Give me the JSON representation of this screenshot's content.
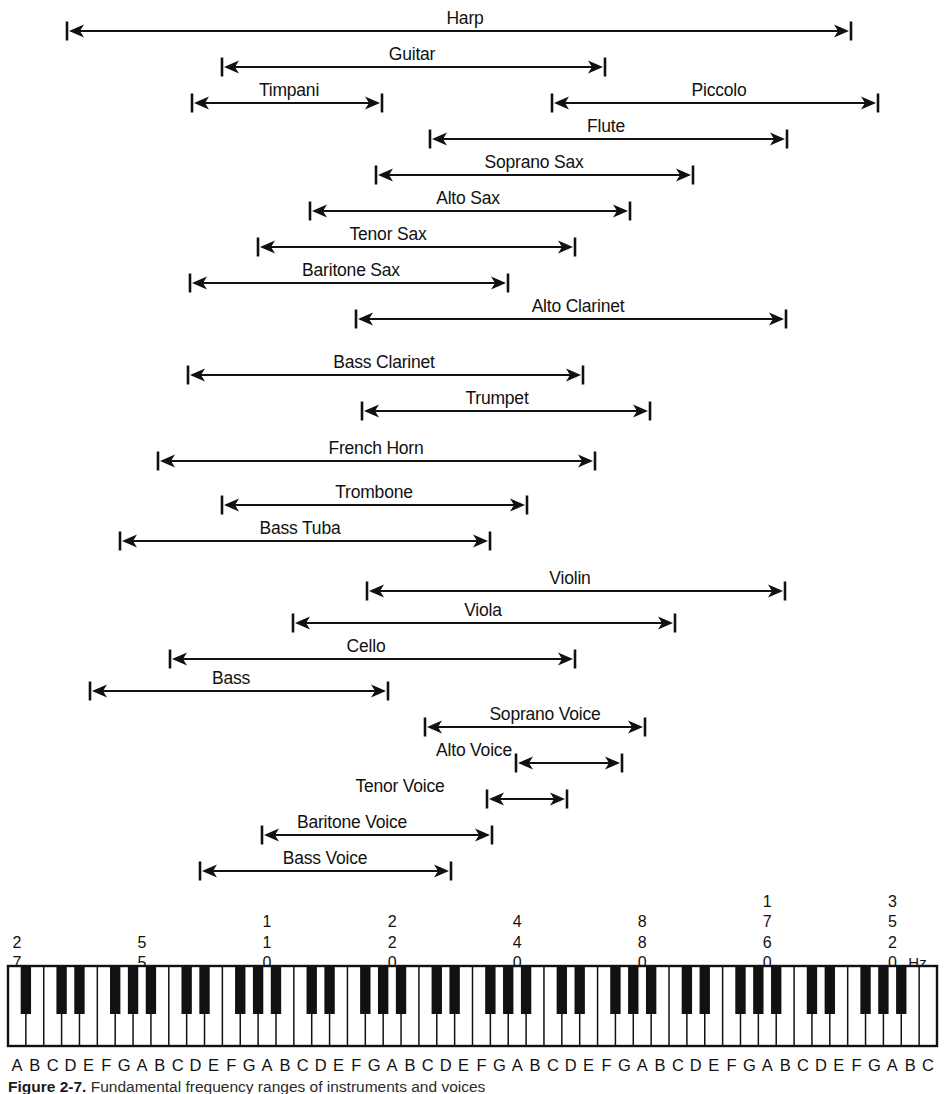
{
  "figure": {
    "caption_prefix": "Figure  2-7.",
    "caption_text": "Fundamental frequency ranges of instruments and voices",
    "hz_unit": "Hz",
    "keyboard": {
      "total_keys": 88,
      "white_keys": 52,
      "start_note": "A",
      "end_note": "C",
      "note_letters": [
        "A",
        "B",
        "C",
        "D",
        "E",
        "F",
        "G",
        "A",
        "B",
        "C",
        "D",
        "E",
        "F",
        "G",
        "A",
        "B",
        "C",
        "D",
        "E",
        "F",
        "G",
        "A",
        "B",
        "C",
        "D",
        "E",
        "F",
        "G",
        "A",
        "B",
        "C",
        "D",
        "E",
        "F",
        "G",
        "A",
        "B",
        "C",
        "D",
        "E",
        "F",
        "G",
        "A",
        "B",
        "C",
        "D",
        "E",
        "F",
        "G",
        "A",
        "B",
        "C"
      ]
    }
  },
  "chart_data": {
    "type": "bar",
    "title": "Fundamental frequency ranges of instruments and voices",
    "xlabel": "Frequency (Hz)",
    "ylabel": "",
    "x_scale": "log (piano keyboard)",
    "xlim": [
      27.5,
      4186
    ],
    "grid": false,
    "legend": "none",
    "frequency_ticks": [
      {
        "label": "27",
        "digits": [
          "2",
          "7"
        ],
        "white_key_index": 0
      },
      {
        "label": "55",
        "digits": [
          "5",
          "5"
        ],
        "white_key_index": 7
      },
      {
        "label": "110",
        "digits": [
          "1",
          "1",
          "0"
        ],
        "white_key_index": 14
      },
      {
        "label": "220",
        "digits": [
          "2",
          "2",
          "0"
        ],
        "white_key_index": 21
      },
      {
        "label": "440",
        "digits": [
          "4",
          "4",
          "0"
        ],
        "white_key_index": 28
      },
      {
        "label": "880",
        "digits": [
          "8",
          "8",
          "0"
        ],
        "white_key_index": 35
      },
      {
        "label": "1760",
        "digits": [
          "1",
          "7",
          "6",
          "0"
        ],
        "white_key_index": 42
      },
      {
        "label": "3520",
        "digits": [
          "3",
          "5",
          "2",
          "0"
        ],
        "white_key_index": 49
      }
    ],
    "categories": [
      "Harp",
      "Guitar",
      "Timpani",
      "Piccolo",
      "Flute",
      "Soprano Sax",
      "Alto Sax",
      "Tenor Sax",
      "Baritone Sax",
      "Alto Clarinet",
      "Bass Clarinet",
      "Trumpet",
      "French Horn",
      "Trombone",
      "Bass Tuba",
      "Violin",
      "Viola",
      "Cello",
      "Bass",
      "Soprano Voice",
      "Alto Voice",
      "Tenor Voice",
      "Baritone Voice",
      "Bass Voice"
    ],
    "ranges": [
      {
        "name": "Harp",
        "row": 0,
        "x1": 67,
        "x2": 851,
        "label_x": 465,
        "label_y": 12
      },
      {
        "name": "Guitar",
        "row": 1,
        "x1": 222,
        "x2": 605,
        "label_x": 412,
        "label_y": 48
      },
      {
        "name": "Timpani",
        "row": 2,
        "x1": 192,
        "x2": 382,
        "label_x": 289,
        "label_y": 84
      },
      {
        "name": "Piccolo",
        "row": 2,
        "x1": 552,
        "x2": 878,
        "label_x": 719,
        "label_y": 84
      },
      {
        "name": "Flute",
        "row": 3,
        "x1": 430,
        "x2": 787,
        "label_x": 606,
        "label_y": 120
      },
      {
        "name": "Soprano Sax",
        "row": 4,
        "x1": 376,
        "x2": 693,
        "label_x": 534,
        "label_y": 156
      },
      {
        "name": "Alto Sax",
        "row": 5,
        "x1": 310,
        "x2": 630,
        "label_x": 468,
        "label_y": 192
      },
      {
        "name": "Tenor Sax",
        "row": 6,
        "x1": 258,
        "x2": 575,
        "label_x": 388,
        "label_y": 228
      },
      {
        "name": "Baritone Sax",
        "row": 7,
        "x1": 190,
        "x2": 508,
        "label_x": 351,
        "label_y": 264
      },
      {
        "name": "Alto Clarinet",
        "row": 8,
        "x1": 356,
        "x2": 786,
        "label_x": 578,
        "label_y": 300
      },
      {
        "name": "Bass Clarinet",
        "row": 9,
        "x1": 188,
        "x2": 583,
        "label_x": 384,
        "label_y": 356
      },
      {
        "name": "Trumpet",
        "row": 10,
        "x1": 362,
        "x2": 650,
        "label_x": 497,
        "label_y": 392
      },
      {
        "name": "French Horn",
        "row": 11,
        "x1": 158,
        "x2": 595,
        "label_x": 376,
        "label_y": 442
      },
      {
        "name": "Trombone",
        "row": 12,
        "x1": 222,
        "x2": 527,
        "label_x": 374,
        "label_y": 486
      },
      {
        "name": "Bass Tuba",
        "row": 13,
        "x1": 120,
        "x2": 490,
        "label_x": 300,
        "label_y": 522
      },
      {
        "name": "Violin",
        "row": 14,
        "x1": 367,
        "x2": 785,
        "label_x": 570,
        "label_y": 572
      },
      {
        "name": "Viola",
        "row": 15,
        "x1": 293,
        "x2": 675,
        "label_x": 483,
        "label_y": 604
      },
      {
        "name": "Cello",
        "row": 16,
        "x1": 170,
        "x2": 575,
        "label_x": 366,
        "label_y": 640
      },
      {
        "name": "Bass",
        "row": 17,
        "x1": 90,
        "x2": 388,
        "label_x": 231,
        "label_y": 672
      },
      {
        "name": "Soprano Voice",
        "row": 18,
        "x1": 425,
        "x2": 645,
        "label_x": 545,
        "label_y": 708
      },
      {
        "name": "Alto Voice",
        "row": 19,
        "x1": 516,
        "x2": 622,
        "label_x": 474,
        "label_y": 744
      },
      {
        "name": "Tenor Voice",
        "row": 20,
        "x1": 487,
        "x2": 567,
        "label_x": 400,
        "label_y": 780
      },
      {
        "name": "Baritone Voice",
        "row": 21,
        "x1": 262,
        "x2": 492,
        "label_x": 352,
        "label_y": 816
      },
      {
        "name": "Bass Voice",
        "row": 22,
        "x1": 200,
        "x2": 451,
        "label_x": 325,
        "label_y": 852
      }
    ]
  }
}
